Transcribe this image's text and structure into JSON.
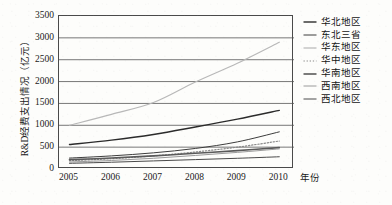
{
  "chart_data": {
    "type": "line",
    "title": "",
    "xlabel": "年份",
    "ylabel": "R&D经费支出情况（亿元）",
    "x": [
      2005,
      2006,
      2007,
      2008,
      2009,
      2010
    ],
    "xlim": [
      2004.75,
      2010.35
    ],
    "ylim": [
      0,
      3500
    ],
    "ytick_labels": [
      "0",
      "500",
      "1000",
      "1500",
      "2000",
      "2500",
      "3000",
      "3500"
    ],
    "ytick_values": [
      0,
      500,
      1000,
      1500,
      2000,
      2500,
      3000,
      3500
    ],
    "xtick_labels": [
      "2005",
      "2006",
      "2007",
      "2008",
      "2009",
      "2010"
    ],
    "grid": "horizontal",
    "legend_position": "right",
    "series": [
      {
        "name": "华北地区",
        "values": [
          560,
          660,
          790,
          960,
          1140,
          1340
        ],
        "color": "#2b2b2b",
        "style": "solid",
        "width": 1.4
      },
      {
        "name": "东北三省",
        "values": [
          250,
          300,
          370,
          470,
          620,
          850
        ],
        "color": "#3d3d3d",
        "style": "solid",
        "width": 1.0
      },
      {
        "name": "华东地区",
        "values": [
          1000,
          1250,
          1520,
          1990,
          2420,
          2900
        ],
        "color": "#b8b8b8",
        "style": "solid",
        "width": 1.2
      },
      {
        "name": "华中地区",
        "values": [
          190,
          235,
          300,
          390,
          500,
          640
        ],
        "color": "#8a8a8a",
        "style": "dotted",
        "width": 1.2
      },
      {
        "name": "华南地区",
        "values": [
          215,
          250,
          300,
          360,
          420,
          490
        ],
        "color": "#5a5a5a",
        "style": "solid",
        "width": 1.6
      },
      {
        "name": "西南地区",
        "values": [
          160,
          195,
          245,
          310,
          380,
          460
        ],
        "color": "#9a9a9a",
        "style": "solid",
        "width": 1.0
      },
      {
        "name": "西北地区",
        "values": [
          130,
          155,
          185,
          215,
          245,
          280
        ],
        "color": "#4a4a4a",
        "style": "solid",
        "width": 1.0
      }
    ]
  },
  "axis": {
    "y_title": "R&D经费支出情况（亿元）",
    "x_title": "年份"
  },
  "colors": {
    "frame": "#4a4a4a",
    "grid": "#555555",
    "text": "#1a1a1a",
    "background": "#fdfdfb"
  }
}
